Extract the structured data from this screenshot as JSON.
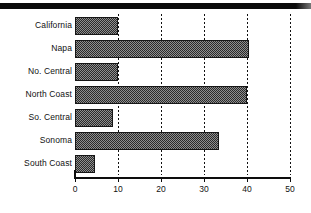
{
  "figure": {
    "top_rule_name": "page-header-rule",
    "caption": ""
  },
  "chart_data": {
    "type": "bar",
    "orientation": "horizontal",
    "title": "",
    "subtitle": "",
    "xlabel": "",
    "ylabel": "",
    "categories": [
      "California",
      "Napa",
      "No. Central",
      "North Coast",
      "So. Central",
      "Sonoma",
      "South Coast"
    ],
    "values": [
      10.0,
      40.5,
      10.0,
      40.0,
      8.8,
      33.5,
      4.7
    ],
    "series": [
      {
        "name": "",
        "values": [
          10.0,
          40.5,
          10.0,
          40.0,
          8.8,
          33.5,
          4.7
        ]
      }
    ],
    "xlim": [
      0,
      50
    ],
    "ylim": null,
    "xticks": [
      0,
      10,
      20,
      30,
      40,
      50
    ],
    "xtick_labels": [
      "0",
      "10",
      "20",
      "30",
      "40",
      "50"
    ],
    "ytick_labels": [
      "California",
      "Napa",
      "No. Central",
      "North Coast",
      "So. Central",
      "Sonoma",
      "South Coast"
    ],
    "grid": {
      "vertical": true,
      "horizontal": false,
      "style": "dotted"
    },
    "legend": {
      "visible": false,
      "position": "none",
      "entries": []
    },
    "colors": {
      "bar_fill": "#8e8e8e",
      "bar_pattern": "#2a2a2a",
      "bar_edge": "#161616",
      "axis": "#0d0d0d",
      "grid": "#111111",
      "text": "#111111",
      "background": "#ffffff",
      "header_rule": "#0b0b0b"
    }
  }
}
